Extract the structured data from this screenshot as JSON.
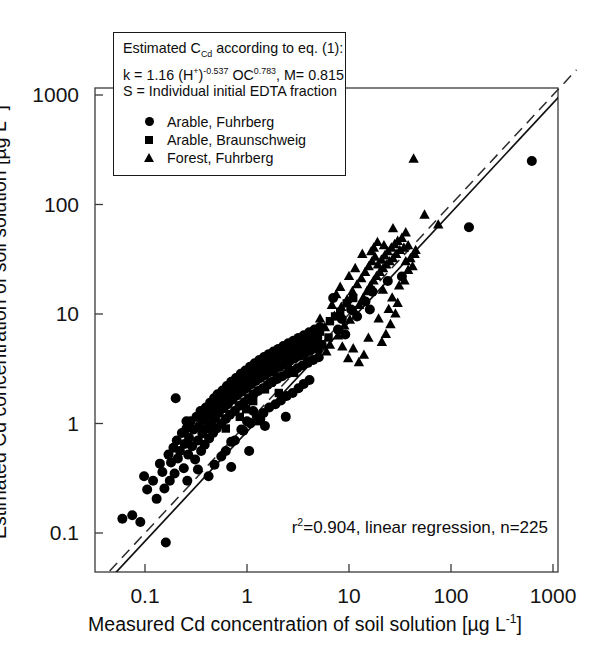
{
  "figure": {
    "caption_box": {
      "lines": [
        "Estimated C_Cd according to eq. (1):",
        "k  = 1.16  (H+)-0.537 OC0.783, M= 0.815",
        "S = Individual initial EDTA fraction"
      ],
      "line1_prefix": "Estimated C",
      "line1_sub": "Cd",
      "line1_suffix": " according to eq. (1):",
      "line2_a": "k  = 1.16  (H",
      "line2_sup1": "+",
      "line2_b": ")",
      "line2_sup2": "-0.537",
      "line2_c": " OC",
      "line2_sup3": "0.783",
      "line2_d": ", M= 0.815",
      "line3": "S = Individual initial EDTA fraction"
    }
  },
  "chart_data": {
    "type": "scatter",
    "title": "",
    "xlabel": "Measured Cd concentration of soil solution [µg L-1]",
    "xlabel_prefix": "Measured Cd concentration of soil solution [µg L",
    "xlabel_sup": "-1",
    "xlabel_suffix": "]",
    "ylabel": "Estimated Cd concentration of soil solution [µg L-1]",
    "ylabel_prefix": "Estimated Cd concentration of soil solution [µg L",
    "ylabel_sup": "-1",
    "ylabel_suffix": "]",
    "xscale": "log",
    "yscale": "log",
    "xlim": [
      0.05,
      1000
    ],
    "ylim": [
      0.06,
      1000
    ],
    "xticks": [
      0.1,
      1,
      10,
      100,
      1000
    ],
    "xtick_labels": [
      "0.1",
      "1",
      "10",
      "100",
      "1000"
    ],
    "yticks": [
      0.1,
      1,
      10,
      100,
      1000
    ],
    "ytick_labels": [
      "0.1",
      "1",
      "10",
      "100",
      "1000"
    ],
    "grid": false,
    "legend_position": "upper-left-inset",
    "annotation": "r2=0.904, linear regression, n=225",
    "annotation_prefix": "r",
    "annotation_sup": "2",
    "annotation_suffix": "=0.904, linear regression, n=225",
    "n_total": 225,
    "r_squared": 0.904,
    "lines": [
      {
        "name": "identity-line",
        "style": "dashed",
        "slope": 1,
        "intercept": 0,
        "label": "1:1 line"
      },
      {
        "name": "regression-line",
        "style": "solid",
        "slope": 1.0,
        "intercept": -0.075,
        "label": "linear regression"
      }
    ],
    "series": [
      {
        "name": "Arable, Fuhrberg",
        "marker": "circle",
        "color": "#000000",
        "points": [
          [
            0.06,
            0.135
          ],
          [
            0.075,
            0.145
          ],
          [
            0.09,
            0.126
          ],
          [
            0.098,
            0.33
          ],
          [
            0.105,
            0.25
          ],
          [
            0.12,
            0.3
          ],
          [
            0.13,
            0.205
          ],
          [
            0.14,
            0.43
          ],
          [
            0.148,
            0.36
          ],
          [
            0.155,
            0.255
          ],
          [
            0.16,
            0.082
          ],
          [
            0.17,
            0.52
          ],
          [
            0.175,
            0.3
          ],
          [
            0.18,
            0.44
          ],
          [
            0.19,
            0.6
          ],
          [
            0.195,
            0.35
          ],
          [
            0.205,
            0.7
          ],
          [
            0.21,
            0.48
          ],
          [
            0.22,
            0.56
          ],
          [
            0.23,
            0.82
          ],
          [
            0.24,
            0.39
          ],
          [
            0.245,
            0.65
          ],
          [
            0.255,
            0.9
          ],
          [
            0.265,
            0.52
          ],
          [
            0.27,
            0.74
          ],
          [
            0.28,
            1.05
          ],
          [
            0.29,
            0.62
          ],
          [
            0.3,
            0.88
          ],
          [
            0.31,
            0.47
          ],
          [
            0.32,
            1.15
          ],
          [
            0.33,
            0.7
          ],
          [
            0.34,
            0.95
          ],
          [
            0.35,
            1.3
          ],
          [
            0.355,
            0.56
          ],
          [
            0.365,
            0.81
          ],
          [
            0.375,
            1.08
          ],
          [
            0.385,
            0.64
          ],
          [
            0.395,
            1.4
          ],
          [
            0.405,
            0.9
          ],
          [
            0.415,
            1.2
          ],
          [
            0.425,
            0.73
          ],
          [
            0.435,
            1.55
          ],
          [
            0.445,
            1.0
          ],
          [
            0.455,
            1.32
          ],
          [
            0.465,
            0.82
          ],
          [
            0.475,
            1.7
          ],
          [
            0.485,
            1.12
          ],
          [
            0.495,
            1.45
          ],
          [
            0.505,
            0.9
          ],
          [
            0.515,
            1.85
          ],
          [
            0.53,
            1.25
          ],
          [
            0.545,
            1.6
          ],
          [
            0.56,
            1.0
          ],
          [
            0.575,
            2.0
          ],
          [
            0.59,
            1.38
          ],
          [
            0.605,
            1.75
          ],
          [
            0.62,
            1.1
          ],
          [
            0.635,
            2.2
          ],
          [
            0.65,
            1.5
          ],
          [
            0.665,
            1.9
          ],
          [
            0.68,
            1.2
          ],
          [
            0.7,
            2.4
          ],
          [
            0.72,
            1.65
          ],
          [
            0.74,
            2.05
          ],
          [
            0.76,
            1.3
          ],
          [
            0.78,
            2.6
          ],
          [
            0.8,
            1.8
          ],
          [
            0.82,
            2.25
          ],
          [
            0.845,
            1.45
          ],
          [
            0.87,
            2.85
          ],
          [
            0.89,
            1.95
          ],
          [
            0.915,
            2.45
          ],
          [
            0.94,
            1.56
          ],
          [
            0.965,
            3.05
          ],
          [
            0.99,
            2.1
          ],
          [
            1.01,
            2.65
          ],
          [
            1.04,
            1.7
          ],
          [
            1.07,
            3.3
          ],
          [
            1.1,
            2.28
          ],
          [
            1.13,
            2.85
          ],
          [
            1.16,
            1.85
          ],
          [
            1.19,
            3.55
          ],
          [
            1.22,
            2.45
          ],
          [
            1.25,
            3.05
          ],
          [
            1.285,
            1.98
          ],
          [
            1.32,
            3.8
          ],
          [
            1.355,
            2.6
          ],
          [
            1.39,
            3.25
          ],
          [
            1.43,
            2.1
          ],
          [
            1.47,
            4.05
          ],
          [
            1.51,
            2.78
          ],
          [
            1.55,
            3.45
          ],
          [
            1.59,
            2.25
          ],
          [
            1.635,
            4.3
          ],
          [
            1.68,
            2.95
          ],
          [
            1.725,
            3.65
          ],
          [
            1.77,
            2.4
          ],
          [
            1.82,
            4.55
          ],
          [
            1.87,
            3.12
          ],
          [
            1.92,
            3.85
          ],
          [
            1.975,
            2.55
          ],
          [
            2.03,
            4.8
          ],
          [
            2.09,
            3.3
          ],
          [
            2.15,
            4.08
          ],
          [
            2.21,
            2.7
          ],
          [
            2.27,
            5.1
          ],
          [
            2.335,
            3.5
          ],
          [
            2.4,
            4.32
          ],
          [
            2.47,
            2.85
          ],
          [
            2.54,
            5.4
          ],
          [
            2.61,
            3.7
          ],
          [
            2.69,
            4.58
          ],
          [
            2.77,
            3.02
          ],
          [
            2.85,
            5.7
          ],
          [
            2.93,
            3.92
          ],
          [
            3.02,
            4.85
          ],
          [
            3.11,
            3.2
          ],
          [
            3.2,
            6.05
          ],
          [
            3.3,
            4.15
          ],
          [
            3.4,
            5.15
          ],
          [
            3.5,
            3.38
          ],
          [
            3.61,
            6.4
          ],
          [
            3.72,
            4.4
          ],
          [
            3.83,
            5.45
          ],
          [
            3.95,
            3.58
          ],
          [
            4.07,
            6.8
          ],
          [
            4.2,
            4.65
          ],
          [
            4.33,
            5.75
          ],
          [
            4.46,
            3.8
          ],
          [
            4.6,
            7.2
          ],
          [
            4.74,
            4.95
          ],
          [
            4.89,
            6.1
          ],
          [
            5.05,
            4.02
          ],
          [
            5.2,
            7.6
          ],
          [
            5.4,
            5.25
          ],
          [
            0.42,
            0.33
          ],
          [
            0.56,
            0.5
          ],
          [
            0.7,
            0.68
          ],
          [
            0.88,
            0.88
          ],
          [
            1.0,
            1.05
          ],
          [
            1.15,
            1.3
          ],
          [
            1.35,
            1.1
          ],
          [
            1.5,
            0.95
          ],
          [
            0.33,
            0.38
          ],
          [
            0.26,
            0.3
          ],
          [
            0.48,
            0.42
          ],
          [
            0.62,
            0.56
          ],
          [
            0.76,
            0.7
          ],
          [
            0.92,
            0.86
          ],
          [
            1.08,
            1.0
          ],
          [
            1.25,
            1.15
          ],
          [
            1.45,
            1.25
          ],
          [
            1.65,
            1.4
          ],
          [
            1.9,
            1.5
          ],
          [
            2.15,
            1.62
          ],
          [
            2.45,
            1.78
          ],
          [
            2.8,
            1.9
          ],
          [
            3.2,
            2.1
          ],
          [
            3.6,
            2.3
          ],
          [
            4.1,
            2.5
          ],
          [
            7.8,
            7.2
          ],
          [
            8.5,
            9.0
          ],
          [
            9.2,
            6.5
          ],
          [
            10.5,
            11.0
          ],
          [
            12.0,
            9.5
          ],
          [
            14.5,
            13.0
          ],
          [
            17.0,
            16.0
          ],
          [
            7.0,
            14.0
          ],
          [
            16.0,
            11.0
          ],
          [
            24.0,
            20.0
          ],
          [
            33.0,
            22.0
          ],
          [
            150.0,
            62.0
          ],
          [
            620.0,
            250.0
          ],
          [
            0.2,
            1.7
          ],
          [
            0.255,
            1.05
          ],
          [
            0.7,
            0.4
          ],
          [
            1.05,
            0.56
          ],
          [
            2.4,
            1.15
          ]
        ]
      },
      {
        "name": "Arable, Braunschweig",
        "marker": "square",
        "color": "#000000",
        "points": [
          [
            0.85,
            1.15
          ],
          [
            1.15,
            1.6
          ],
          [
            1.5,
            2.05
          ],
          [
            1.95,
            2.65
          ],
          [
            2.5,
            3.4
          ],
          [
            3.2,
            4.3
          ],
          [
            4.1,
            5.5
          ],
          [
            5.2,
            6.9
          ],
          [
            6.5,
            8.6
          ],
          [
            8.2,
            10.5
          ],
          [
            1.3,
            1.05
          ],
          [
            2.05,
            1.9
          ],
          [
            2.9,
            2.9
          ],
          [
            3.9,
            3.7
          ],
          [
            5.0,
            4.8
          ],
          [
            6.3,
            6.1
          ],
          [
            0.62,
            0.9
          ],
          [
            0.98,
            1.35
          ],
          [
            1.7,
            2.35
          ],
          [
            2.7,
            3.05
          ],
          [
            9.5,
            12.5
          ],
          [
            11.0,
            14.0
          ],
          [
            7.3,
            9.5
          ],
          [
            4.6,
            6.2
          ],
          [
            3.5,
            4.9
          ]
        ]
      },
      {
        "name": "Forest, Fuhrberg",
        "marker": "triangle",
        "color": "#000000",
        "points": [
          [
            5.8,
            7.5
          ],
          [
            6.5,
            5.2
          ],
          [
            7.2,
            9.5
          ],
          [
            7.8,
            6.3
          ],
          [
            8.4,
            11.5
          ],
          [
            9.0,
            7.8
          ],
          [
            9.6,
            13.5
          ],
          [
            10.2,
            8.8
          ],
          [
            10.8,
            16.0
          ],
          [
            11.4,
            10.5
          ],
          [
            12.0,
            18.5
          ],
          [
            12.6,
            12.0
          ],
          [
            13.2,
            21.0
          ],
          [
            13.8,
            14.0
          ],
          [
            14.4,
            24.0
          ],
          [
            15.0,
            16.0
          ],
          [
            15.6,
            27.0
          ],
          [
            16.2,
            18.0
          ],
          [
            16.8,
            30.0
          ],
          [
            17.4,
            20.0
          ],
          [
            18.0,
            33.0
          ],
          [
            18.6,
            22.0
          ],
          [
            19.2,
            28.0
          ],
          [
            20.0,
            24.0
          ],
          [
            20.8,
            31.0
          ],
          [
            21.6,
            26.0
          ],
          [
            22.4,
            34.0
          ],
          [
            23.2,
            28.0
          ],
          [
            24.0,
            37.0
          ],
          [
            25.0,
            30.0
          ],
          [
            26.0,
            40.0
          ],
          [
            27.0,
            32.0
          ],
          [
            28.0,
            43.0
          ],
          [
            29.0,
            35.0
          ],
          [
            30.0,
            46.0
          ],
          [
            31.5,
            38.0
          ],
          [
            33.0,
            49.0
          ],
          [
            34.5,
            40.0
          ],
          [
            36.0,
            30.0
          ],
          [
            38.0,
            25.0
          ],
          [
            40.0,
            32.0
          ],
          [
            42.0,
            27.0
          ],
          [
            44.0,
            35.0
          ],
          [
            17.5,
            40.0
          ],
          [
            19.0,
            45.0
          ],
          [
            21.0,
            5.5
          ],
          [
            23.0,
            6.5
          ],
          [
            25.5,
            8.0
          ],
          [
            28.5,
            10.0
          ],
          [
            14.0,
            4.2
          ],
          [
            12.5,
            3.6
          ],
          [
            11.0,
            4.8
          ],
          [
            9.8,
            3.9
          ],
          [
            8.6,
            5.0
          ],
          [
            15.5,
            6.0
          ],
          [
            31.0,
            18.0
          ],
          [
            35.0,
            20.0
          ],
          [
            43.0,
            260.0
          ],
          [
            55.0,
            80.0
          ],
          [
            75.0,
            65.0
          ],
          [
            6.8,
            12.0
          ],
          [
            7.5,
            15.0
          ],
          [
            8.2,
            17.5
          ],
          [
            13.5,
            35.0
          ],
          [
            16.5,
            37.0
          ],
          [
            22.0,
            42.0
          ],
          [
            26.5,
            14.0
          ],
          [
            30.0,
            12.5
          ],
          [
            19.5,
            9.0
          ],
          [
            24.5,
            11.0
          ],
          [
            10.0,
            22.0
          ],
          [
            11.5,
            26.0
          ],
          [
            36.0,
            55.0
          ],
          [
            27.0,
            60.0
          ],
          [
            4.8,
            5.8
          ],
          [
            5.2,
            9.0
          ],
          [
            6.0,
            4.5
          ],
          [
            38.0,
            42.0
          ],
          [
            45.0,
            38.0
          ],
          [
            21.5,
            16.5
          ]
        ]
      }
    ]
  }
}
